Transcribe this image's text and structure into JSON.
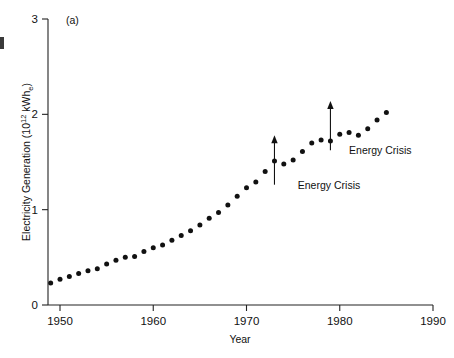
{
  "figure": {
    "panel_label": "(a)",
    "background_color": "#ffffff",
    "marker_color": "#111111",
    "axis_color": "#222222"
  },
  "chart_data": {
    "type": "scatter",
    "title": "",
    "subtitle": "",
    "xlabel": "Year",
    "ylabel": "Electricity Generation (10¹² kWhₑ)",
    "ylabel_parts": {
      "main": "Electricity Generation (10",
      "exponent": "12",
      "unit": " kWh",
      "subscript": "e",
      "close": ")"
    },
    "xlim": [
      1948,
      1990
    ],
    "ylim": [
      0,
      3
    ],
    "xticks": [
      1950,
      1960,
      1970,
      1980,
      1990
    ],
    "xtick_labels": [
      "1950",
      "1960",
      "1970",
      "1980",
      "1990"
    ],
    "yticks": [
      0,
      1,
      2,
      3
    ],
    "ytick_labels": [
      "0",
      "1",
      "2",
      "3"
    ],
    "grid": false,
    "legend": "none",
    "series": [
      {
        "name": "Electricity Generation",
        "marker": "filled-circle",
        "x": [
          1949,
          1950,
          1951,
          1952,
          1953,
          1954,
          1955,
          1956,
          1957,
          1958,
          1959,
          1960,
          1961,
          1962,
          1963,
          1964,
          1965,
          1966,
          1967,
          1968,
          1969,
          1970,
          1971,
          1972,
          1973,
          1974,
          1975,
          1976,
          1977,
          1978,
          1979,
          1980,
          1981,
          1982,
          1983,
          1984,
          1985
        ],
        "y": [
          0.23,
          0.27,
          0.3,
          0.33,
          0.36,
          0.38,
          0.43,
          0.47,
          0.5,
          0.51,
          0.56,
          0.6,
          0.63,
          0.68,
          0.73,
          0.78,
          0.84,
          0.91,
          0.97,
          1.05,
          1.14,
          1.23,
          1.29,
          1.4,
          1.51,
          1.48,
          1.52,
          1.61,
          1.7,
          1.73,
          1.72,
          1.79,
          1.81,
          1.78,
          1.85,
          1.94,
          2.02
        ]
      }
    ],
    "annotations": [
      {
        "text": "Energy Crisis",
        "target_x": 1973,
        "target_y": 1.78,
        "label_x": 1975.5,
        "label_y": 1.22
      },
      {
        "text": "Energy Crisis",
        "target_x": 1979,
        "target_y": 2.14,
        "label_x": 1981.0,
        "label_y": 1.58
      }
    ]
  }
}
